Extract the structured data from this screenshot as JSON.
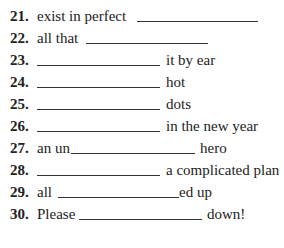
{
  "exercise": {
    "items": [
      {
        "number": "21.",
        "before": "exist in perfect",
        "after": ""
      },
      {
        "number": "22.",
        "before": "all that",
        "after": ""
      },
      {
        "number": "23.",
        "before": "",
        "after": "it by ear"
      },
      {
        "number": "24.",
        "before": "",
        "after": "hot"
      },
      {
        "number": "25.",
        "before": "",
        "after": "dots"
      },
      {
        "number": "26.",
        "before": "",
        "after": "in the new year"
      },
      {
        "number": "27.",
        "before": "an un",
        "after": "hero"
      },
      {
        "number": "28.",
        "before": "",
        "after": "a complicated plan"
      },
      {
        "number": "29.",
        "before": "all",
        "after": "ed up"
      },
      {
        "number": "30.",
        "before": "Please",
        "after": "down!"
      }
    ]
  }
}
